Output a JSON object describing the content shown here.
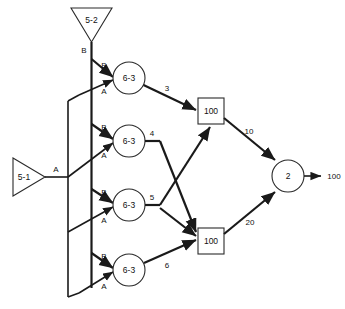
{
  "diagram": {
    "type": "signal-flow-network",
    "sources": [
      {
        "id": "src-top",
        "label": "5-2",
        "shape": "triangle-down",
        "output_port": "B"
      },
      {
        "id": "src-left",
        "label": "5-1",
        "shape": "triangle-right",
        "output_port": "A"
      }
    ],
    "bus_labels": {
      "top_bus": "B",
      "left_bus": "A"
    },
    "gates": [
      {
        "id": "gate-1",
        "label": "6-3",
        "shape": "circle",
        "input_top": "B",
        "input_bottom": "A",
        "output_weight": "3"
      },
      {
        "id": "gate-2",
        "label": "6-3",
        "shape": "circle",
        "input_top": "B",
        "input_bottom": "A",
        "output_weight": "4"
      },
      {
        "id": "gate-3",
        "label": "6-3",
        "shape": "circle",
        "input_top": "B",
        "input_bottom": "A",
        "output_weight": "5"
      },
      {
        "id": "gate-4",
        "label": "6-3",
        "shape": "circle",
        "input_top": "B",
        "input_bottom": "A",
        "output_weight": "6"
      }
    ],
    "accumulators": [
      {
        "id": "acc-top",
        "label": "100",
        "shape": "square",
        "output_weight": "10"
      },
      {
        "id": "acc-bottom",
        "label": "100",
        "shape": "square",
        "output_weight": "20"
      }
    ],
    "output_node": {
      "id": "out-node",
      "label": "2",
      "shape": "circle"
    },
    "output_value": "100",
    "colors": {
      "stroke": "#1a1a1a",
      "node_stroke": "#2a2a2a",
      "fill": "#ffffff",
      "text": "#111111",
      "background": "#ffffff"
    }
  }
}
